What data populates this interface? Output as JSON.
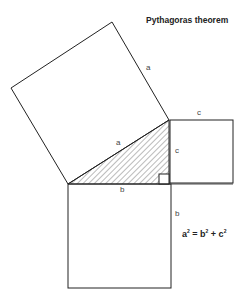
{
  "title": "Pythagoras theorem",
  "labels": {
    "hyp_square_side": "a",
    "hypotenuse": "a",
    "leg_c_top": "c",
    "leg_c": "c",
    "leg_b": "b",
    "leg_b_side": "b"
  },
  "formula": {
    "a": "a",
    "a_exp": "2",
    "eq": " = ",
    "b": "b",
    "b_exp": "2",
    "plus": " + ",
    "c": "c",
    "c_exp": "2"
  },
  "colors": {
    "stroke": "#222222",
    "hatch": "#555555",
    "background": "#ffffff"
  }
}
